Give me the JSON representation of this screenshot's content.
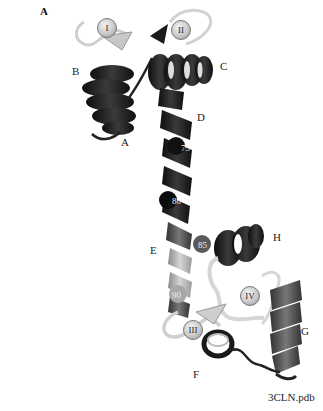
{
  "figure": {
    "panel_label": "A",
    "pdb_id": "3CLN.pdb",
    "helix_labels": [
      "A",
      "B",
      "C",
      "D",
      "E",
      "F",
      "G",
      "H"
    ],
    "calcium_sites": [
      "I",
      "II",
      "III",
      "IV"
    ],
    "residue_numbers": [
      "75",
      "80",
      "85",
      "90"
    ],
    "colors": {
      "dark_ribbon": "#1e1e1e",
      "mid_ribbon": "#555555",
      "light_ribbon": "#bdbdbd",
      "loop": "#e6e6e6",
      "ion_sphere": "#cfcfcf"
    }
  }
}
